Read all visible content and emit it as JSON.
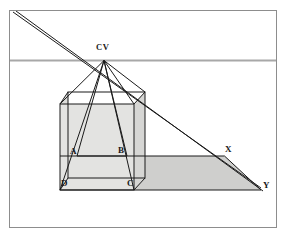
{
  "figure": {
    "frame": {
      "x": 9,
      "y": 10,
      "width": 268,
      "height": 218,
      "stroke": "#8d8d8d",
      "fill": "#ffffff",
      "stroke_width": 1
    },
    "colors": {
      "line": "#1a1a1a",
      "horizon": "#a8a8a8",
      "frame": "#8d8d8d",
      "fill_light": "#e3e3e1",
      "fill_mid": "#d9d9d7",
      "fill_dark": "#cfcfcd",
      "background": "#ffffff",
      "label": "#1a1a1a"
    },
    "horizon_line": {
      "y": 60,
      "x1": 9,
      "x2": 277,
      "stroke": "#a8a8a8",
      "stroke_width": 2
    },
    "labels": [
      {
        "id": "cv",
        "text": "CV",
        "x": 96,
        "y": 43
      },
      {
        "id": "a",
        "text": "A",
        "x": 70,
        "y": 147
      },
      {
        "id": "b",
        "text": "B",
        "x": 118,
        "y": 146
      },
      {
        "id": "d",
        "text": "D",
        "x": 61,
        "y": 179
      },
      {
        "id": "c",
        "text": "C",
        "x": 127,
        "y": 179
      },
      {
        "id": "x",
        "text": "X",
        "x": 225,
        "y": 145
      },
      {
        "id": "y",
        "text": "Y",
        "x": 263,
        "y": 181
      }
    ],
    "points": {
      "CV": {
        "x": 104.0,
        "y": 60.5
      },
      "A": {
        "x": 77.0,
        "y": 156.0
      },
      "B": {
        "x": 127.0,
        "y": 156.0
      },
      "D": {
        "x": 60.0,
        "y": 190.0
      },
      "C": {
        "x": 134.0,
        "y": 190.0
      },
      "X": {
        "x": 224.5,
        "y": 156.0
      },
      "Y": {
        "x": 261.0,
        "y": 190.0
      },
      "cube_front_tl": {
        "x": 60.0,
        "y": 104.0
      },
      "cube_front_tr": {
        "x": 134.0,
        "y": 104.0
      },
      "cube_back_tl": {
        "x": 68.0,
        "y": 92.0
      },
      "cube_back_tr": {
        "x": 145.0,
        "y": 92.0
      },
      "cube_back_bl": {
        "x": 68.0,
        "y": 178.0
      },
      "cube_back_br": {
        "x": 145.0,
        "y": 178.0
      }
    },
    "ray_lines_from_cv": [
      "D",
      "C",
      "A",
      "B",
      "cube_front_tl",
      "cube_front_tr"
    ],
    "diagonal_double_line": {
      "from": {
        "x": 14,
        "y": 12
      },
      "through_cv": true,
      "to": {
        "x": 261,
        "y": 190
      },
      "offset_px": 2.2
    },
    "ground_plane_right": {
      "description": "shaded floor polygon from C to X to Y",
      "vertices": [
        [
          134,
          156
        ],
        [
          224.5,
          156
        ],
        [
          261,
          190
        ],
        [
          134,
          190
        ]
      ]
    }
  }
}
